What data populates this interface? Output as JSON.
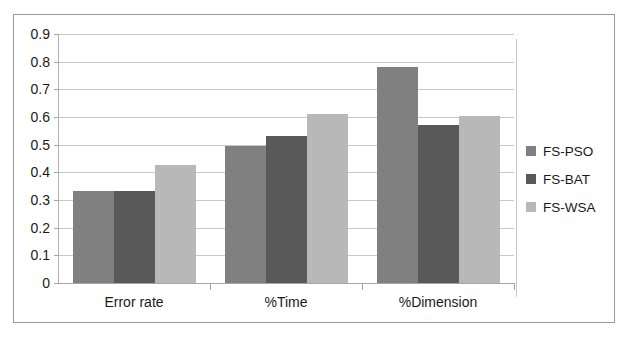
{
  "scan_artifact": {
    "top_text": ""
  },
  "chart_data": {
    "type": "bar",
    "title": "",
    "xlabel": "",
    "ylabel": "",
    "grid": true,
    "legend_position": "right",
    "ylim": [
      0,
      0.9
    ],
    "ytick_labels": [
      "0.9",
      "0.8",
      "0.7",
      "0.6",
      "0.5",
      "0.4",
      "0.3",
      "0.2",
      "0.1",
      "0"
    ],
    "ytick_values": [
      0.9,
      0.8,
      0.7,
      0.6,
      0.5,
      0.4,
      0.3,
      0.2,
      0.1,
      0
    ],
    "categories": [
      "Error rate",
      "%Time",
      "%Dimension"
    ],
    "series": [
      {
        "name": "FS-PSO",
        "color": "#808080",
        "values": [
          0.333,
          0.495,
          0.78
        ]
      },
      {
        "name": "FS-BAT",
        "color": "#595959",
        "values": [
          0.332,
          0.53,
          0.57
        ]
      },
      {
        "name": "FS-WSA",
        "color": "#b8b8b8",
        "values": [
          0.425,
          0.61,
          0.605
        ]
      }
    ]
  }
}
